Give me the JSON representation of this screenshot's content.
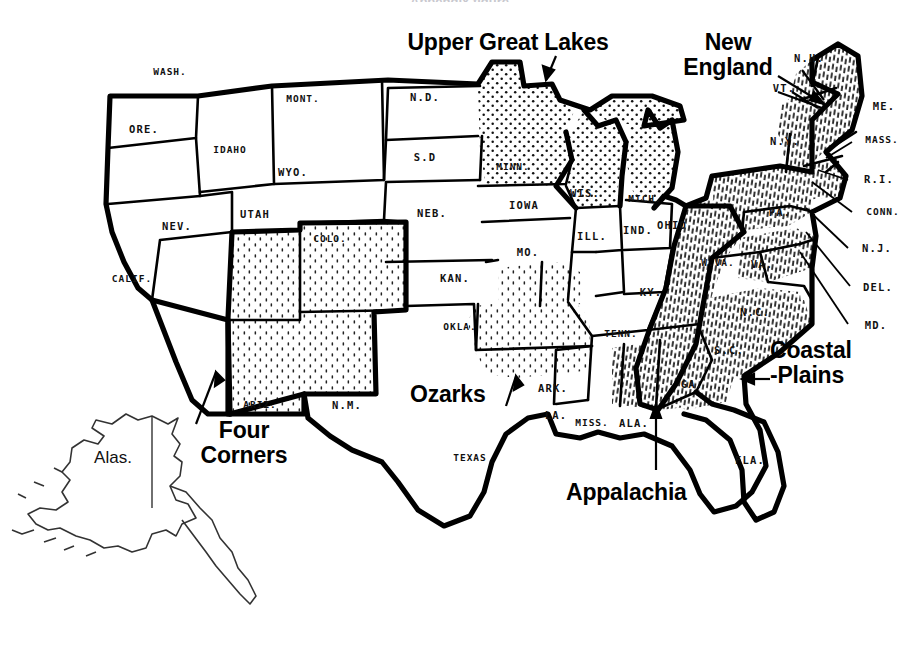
{
  "top_partial_text": "Appendix figure",
  "colors": {
    "ink": "#111111",
    "paper": "#ffffff",
    "outline": "#000000"
  },
  "regions": [
    {
      "id": "upper-great-lakes",
      "label": "Upper Great Lakes",
      "lines": [
        "Upper Great Lakes"
      ],
      "x": 508,
      "y": 30,
      "align": "center",
      "pattern": "dots",
      "states": [
        "MINN.",
        "WIS.",
        "MICH."
      ]
    },
    {
      "id": "new-england",
      "label": "New England",
      "lines": [
        "New",
        "England"
      ],
      "x": 728,
      "y": 30,
      "align": "center",
      "pattern": "hatch",
      "states": [
        "ME.",
        "N.H.",
        "VT.",
        "MASS.",
        "R.I.",
        "CONN."
      ]
    },
    {
      "id": "four-corners",
      "label": "Four Corners",
      "lines": [
        "Four",
        "Corners"
      ],
      "x": 244,
      "y": 418,
      "align": "center",
      "pattern": "stipple",
      "states": [
        "UTAH",
        "COLO.",
        "ARIZ.",
        "N.M."
      ]
    },
    {
      "id": "ozarks",
      "label": "Ozarks",
      "lines": [
        "Ozarks"
      ],
      "x": 410,
      "y": 382,
      "align": "left",
      "pattern": "stipple",
      "states": [
        "MO.",
        "ARK.",
        "OKLA."
      ]
    },
    {
      "id": "appalachia",
      "label": "Appalachia",
      "lines": [
        "Appalachia"
      ],
      "x": 566,
      "y": 480,
      "align": "left",
      "pattern": "hatch",
      "states": [
        "W.VA.",
        "KY.",
        "TENN.",
        "VA.",
        "N.C.",
        "ALA.",
        "GA.",
        "PA."
      ]
    },
    {
      "id": "coastal-plains",
      "label": "Coastal Plains",
      "lines": [
        "Coastal",
        "-Plains"
      ],
      "x": 770,
      "y": 338,
      "align": "left",
      "pattern": "hatch",
      "states": [
        "N.C.",
        "S.C.",
        "GA.",
        "VA.",
        "MD.",
        "DEL.",
        "N.J."
      ]
    }
  ],
  "states": [
    {
      "code": "WASH.",
      "x": 170,
      "y": 72
    },
    {
      "code": "ORE.",
      "x": 144,
      "y": 129
    },
    {
      "code": "IDAHO",
      "x": 230,
      "y": 150
    },
    {
      "code": "MONT.",
      "x": 303,
      "y": 99
    },
    {
      "code": "WYO.",
      "x": 293,
      "y": 172
    },
    {
      "code": "NEV.",
      "x": 177,
      "y": 226
    },
    {
      "code": "UTAH",
      "x": 255,
      "y": 214
    },
    {
      "code": "COLO.",
      "x": 330,
      "y": 239
    },
    {
      "code": "CALIF.",
      "x": 132,
      "y": 279
    },
    {
      "code": "ARIZ.",
      "x": 260,
      "y": 405
    },
    {
      "code": "N.M.",
      "x": 347,
      "y": 405
    },
    {
      "code": "N.D.",
      "x": 425,
      "y": 97
    },
    {
      "code": "S.D",
      "x": 425,
      "y": 157
    },
    {
      "code": "NEB.",
      "x": 432,
      "y": 213
    },
    {
      "code": "KAN.",
      "x": 455,
      "y": 278
    },
    {
      "code": "OKLA.",
      "x": 460,
      "y": 327
    },
    {
      "code": "TEXAS",
      "x": 470,
      "y": 458
    },
    {
      "code": "MINN.",
      "x": 513,
      "y": 167
    },
    {
      "code": "IOWA",
      "x": 524,
      "y": 205
    },
    {
      "code": "MO.",
      "x": 528,
      "y": 252
    },
    {
      "code": "ARK.",
      "x": 553,
      "y": 388
    },
    {
      "code": "LA.",
      "x": 556,
      "y": 415
    },
    {
      "code": "MISS.",
      "x": 592,
      "y": 423
    },
    {
      "code": "ALA.",
      "x": 634,
      "y": 423
    },
    {
      "code": "WIS.",
      "x": 585,
      "y": 193
    },
    {
      "code": "ILL.",
      "x": 592,
      "y": 236
    },
    {
      "code": "MICH.",
      "x": 645,
      "y": 199
    },
    {
      "code": "IND.",
      "x": 638,
      "y": 230
    },
    {
      "code": "OHIO",
      "x": 672,
      "y": 225
    },
    {
      "code": "KY.",
      "x": 651,
      "y": 292
    },
    {
      "code": "TENN.",
      "x": 621,
      "y": 334
    },
    {
      "code": "W.VA.",
      "x": 718,
      "y": 263
    },
    {
      "code": "VA.",
      "x": 762,
      "y": 264
    },
    {
      "code": "N.C.",
      "x": 755,
      "y": 312
    },
    {
      "code": "S.C.",
      "x": 729,
      "y": 350
    },
    {
      "code": "GA.",
      "x": 692,
      "y": 384
    },
    {
      "code": "FLA.",
      "x": 750,
      "y": 460
    },
    {
      "code": "PA.",
      "x": 780,
      "y": 212
    },
    {
      "code": "N.Y.",
      "x": 785,
      "y": 141
    },
    {
      "code": "VT.",
      "x": 784,
      "y": 88
    },
    {
      "code": "N.H.",
      "x": 809,
      "y": 58
    },
    {
      "code": "ME.",
      "x": 884,
      "y": 106
    },
    {
      "code": "MASS.",
      "x": 882,
      "y": 140
    },
    {
      "code": "R.I.",
      "x": 879,
      "y": 179
    },
    {
      "code": "CONN.",
      "x": 883,
      "y": 212
    },
    {
      "code": "N.J.",
      "x": 877,
      "y": 248
    },
    {
      "code": "DEL.",
      "x": 878,
      "y": 287
    },
    {
      "code": "MD.",
      "x": 876,
      "y": 325
    }
  ],
  "alaska": {
    "label": "Alas.",
    "x": 113,
    "y": 458
  },
  "leader_lines": [
    {
      "from_region": "upper-great-lakes",
      "x1": 556,
      "y1": 54,
      "x2": 546,
      "y2": 78
    },
    {
      "from_region": "new-england",
      "x1": 774,
      "y1": 78,
      "x2": 818,
      "y2": 98
    },
    {
      "from_region": "new-england",
      "x1": 800,
      "y1": 104,
      "x2": 826,
      "y2": 98
    },
    {
      "from_region": "four-corners",
      "x1": 196,
      "y1": 420,
      "x2": 216,
      "y2": 376
    },
    {
      "from_region": "ozarks",
      "x1": 504,
      "y1": 404,
      "x2": 514,
      "y2": 378
    },
    {
      "from_region": "appalachia",
      "x1": 655,
      "y1": 470,
      "x2": 655,
      "y2": 408
    },
    {
      "from_region": "coastal-plains",
      "x1": 766,
      "y1": 378,
      "x2": 740,
      "y2": 378
    }
  ]
}
